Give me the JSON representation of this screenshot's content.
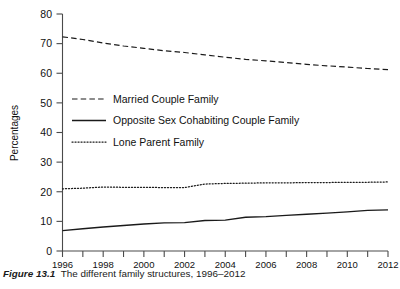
{
  "figure": {
    "number_label": "Figure 13.1",
    "caption_text": "The different family structures, 1996–2012"
  },
  "chart_data": {
    "type": "line",
    "title": "",
    "xlabel": "",
    "ylabel": "Percentages",
    "xlim": [
      1996,
      2012
    ],
    "ylim": [
      0,
      80
    ],
    "ytick_values": [
      0,
      10,
      20,
      30,
      40,
      50,
      60,
      70,
      80
    ],
    "ytick_labels": [
      "0",
      "10",
      "20",
      "30",
      "40",
      "50",
      "60",
      "70",
      "80"
    ],
    "xtick_values": [
      1996,
      1997,
      1998,
      1999,
      2000,
      2001,
      2002,
      2003,
      2004,
      2005,
      2006,
      2007,
      2008,
      2009,
      2010,
      2011,
      2012
    ],
    "xtick_labels_shown": [
      "1996",
      "1998",
      "2000",
      "2002",
      "2004",
      "2006",
      "2008",
      "2010",
      "2012"
    ],
    "grid": false,
    "legend_position": "center-left",
    "x": [
      1996,
      1997,
      1998,
      1999,
      2000,
      2001,
      2002,
      2003,
      2004,
      2005,
      2006,
      2007,
      2008,
      2009,
      2010,
      2011,
      2012
    ],
    "series": [
      {
        "name": "Married Couple Family",
        "style": "dashed",
        "color": "#1a1a1a",
        "values": [
          72.3,
          71.4,
          70.2,
          69.2,
          68.4,
          67.6,
          67.0,
          66.2,
          65.4,
          64.7,
          64.2,
          63.6,
          63.0,
          62.5,
          62.1,
          61.6,
          61.2
        ]
      },
      {
        "name": "Opposite Sex Cohabiting Couple Family",
        "style": "solid",
        "color": "#1a1a1a",
        "values": [
          6.9,
          7.5,
          8.1,
          8.6,
          9.1,
          9.5,
          9.6,
          10.3,
          10.4,
          11.4,
          11.6,
          12.0,
          12.4,
          12.8,
          13.2,
          13.7,
          13.9
        ]
      },
      {
        "name": "Lone Parent Family",
        "style": "dotted",
        "color": "#1a1a1a",
        "values": [
          21.0,
          21.2,
          21.6,
          21.5,
          21.5,
          21.4,
          21.4,
          22.6,
          22.8,
          22.9,
          23.0,
          23.0,
          23.1,
          23.1,
          23.2,
          23.2,
          23.3
        ]
      }
    ],
    "legend_entries": [
      {
        "label": "Married Couple Family",
        "style": "dashed"
      },
      {
        "label": "Opposite Sex Cohabiting Couple Family",
        "style": "solid"
      },
      {
        "label": "Lone Parent Family",
        "style": "dotted"
      }
    ]
  }
}
